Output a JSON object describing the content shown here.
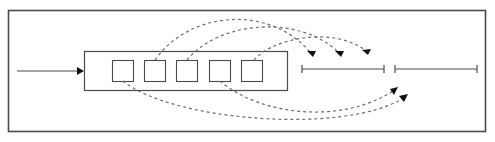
{
  "diagram": {
    "title": "",
    "colors": {
      "frame": "#4a4a4a",
      "line": "#4a4a4a",
      "dashed_arc": "#6b6b6b",
      "arrowhead": "#111111",
      "background": "#ffffff"
    },
    "elements": {
      "input_arrow": {
        "from": "left-edge",
        "to": "container-box"
      },
      "container_box": {
        "slots": 5
      },
      "output_ranges": [
        {
          "id": "range-1",
          "label": ""
        },
        {
          "id": "range-2",
          "label": ""
        }
      ],
      "arcs_over": [
        {
          "from_slot": 2,
          "to": "range-1-start"
        },
        {
          "from_slot": 3,
          "to": "range-1-mid"
        },
        {
          "from_slot": 5,
          "to": "range-1-end"
        }
      ],
      "arcs_under": [
        {
          "from_slot": 4,
          "to": "range-2-start"
        },
        {
          "from_slot": 1,
          "to": "range-2-near-start"
        }
      ]
    }
  }
}
